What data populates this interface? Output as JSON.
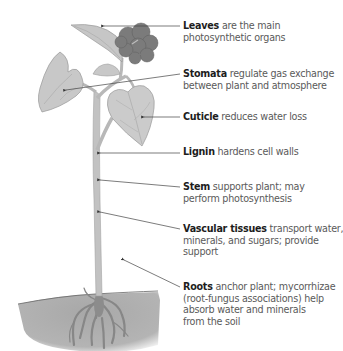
{
  "figure": {
    "colors": {
      "leaf": "#c9c9c9",
      "leaf_edge": "#9a9a9a",
      "flower_cluster": "#7a7a7a",
      "stem": "#bdbdbd",
      "soil": "#aaaaaa",
      "roots": "#8a8a8a",
      "leader_line": "#444444",
      "term_text": "#1d1d1d",
      "desc_text": "#5a5a5a"
    },
    "labels": [
      {
        "term": "Leaves",
        "desc_lines": [
          " are the main",
          "photosynthetic organs"
        ]
      },
      {
        "term": "Stomata",
        "desc_lines": [
          " regulate gas exchange",
          "between plant and atmosphere"
        ]
      },
      {
        "term": "Cuticle",
        "desc_lines": [
          " reduces water loss"
        ]
      },
      {
        "term": "Lignin",
        "desc_lines": [
          " hardens cell walls"
        ]
      },
      {
        "term": "Stem",
        "desc_lines": [
          " supports plant; may",
          "perform photosynthesis"
        ]
      },
      {
        "term": "Vascular tissues",
        "desc_lines": [
          " transport water,",
          "minerals, and sugars; provide",
          "support"
        ]
      },
      {
        "term": "Roots",
        "desc_lines": [
          " anchor plant; mycorrhizae",
          "(root-fungus associations) help",
          "absorb water and minerals",
          "from the soil"
        ]
      }
    ]
  }
}
